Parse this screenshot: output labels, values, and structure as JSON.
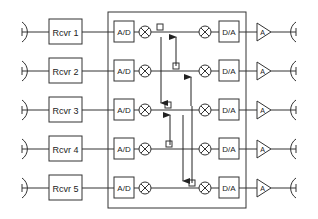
{
  "diagram": {
    "rows": [
      {
        "receiver": "Rcvr 1",
        "adc": "A/D",
        "dac": "D/A",
        "amp": "A",
        "y": 32
      },
      {
        "receiver": "Rcvr 2",
        "adc": "A/D",
        "dac": "D/A",
        "amp": "A",
        "y": 71
      },
      {
        "receiver": "Rcvr 3",
        "adc": "A/D",
        "dac": "D/A",
        "amp": "A",
        "y": 110
      },
      {
        "receiver": "Rcvr 4",
        "adc": "A/D",
        "dac": "D/A",
        "amp": "A",
        "y": 149
      },
      {
        "receiver": "Rcvr 5",
        "adc": "A/D",
        "dac": "D/A",
        "amp": "A",
        "y": 188
      }
    ],
    "colors": {
      "stroke": "#333333",
      "background": "#ffffff"
    }
  }
}
